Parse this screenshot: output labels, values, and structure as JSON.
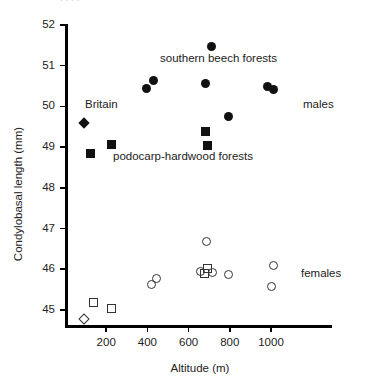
{
  "figure": {
    "axis_color": "#000000",
    "marker_filled_color": "#111111",
    "marker_open_color": "#333333",
    "top_cut_text": "· · · ·"
  },
  "annotations": {
    "britain": "Britain",
    "southern_beech": "southern beech forests",
    "podocarp": "podocarp-hardwood forests",
    "males": "males",
    "females": "females"
  },
  "chart_data": {
    "type": "scatter",
    "title": "",
    "xlabel": "Altitude (m)",
    "ylabel": "Condylobasal length (mm)",
    "xlim": [
      0,
      1300
    ],
    "ylim": [
      44.6,
      52
    ],
    "xticks": [
      200,
      400,
      600,
      800,
      1000
    ],
    "xtick_labels": [
      "200",
      "400",
      "600",
      "800",
      "1000"
    ],
    "yticks": [
      45,
      46,
      47,
      48,
      49,
      50,
      51,
      52
    ],
    "ytick_labels": [
      "45",
      "46",
      "47",
      "48",
      "49",
      "50",
      "51",
      "52"
    ],
    "grid": false,
    "legend_position": "right-inline",
    "series": [
      {
        "name": "males - southern beech forests",
        "marker": "circle-filled",
        "group": "males",
        "points": [
          {
            "x": 395,
            "y": 50.44
          },
          {
            "x": 432,
            "y": 50.63
          },
          {
            "x": 710,
            "y": 51.47
          },
          {
            "x": 680,
            "y": 50.56
          },
          {
            "x": 792,
            "y": 49.76
          },
          {
            "x": 985,
            "y": 50.48
          },
          {
            "x": 1010,
            "y": 50.41
          }
        ]
      },
      {
        "name": "males - podocarp-hardwood forests",
        "marker": "square-filled",
        "group": "males",
        "points": [
          {
            "x": 126,
            "y": 48.84
          },
          {
            "x": 228,
            "y": 49.07
          },
          {
            "x": 680,
            "y": 49.38
          },
          {
            "x": 690,
            "y": 49.05
          }
        ]
      },
      {
        "name": "males - Britain",
        "marker": "diamond-filled",
        "group": "males",
        "points": [
          {
            "x": 92,
            "y": 49.59
          }
        ]
      },
      {
        "name": "females - southern beech forests",
        "marker": "circle-open",
        "group": "females",
        "points": [
          {
            "x": 422,
            "y": 45.63
          },
          {
            "x": 442,
            "y": 45.78
          },
          {
            "x": 685,
            "y": 46.67
          },
          {
            "x": 660,
            "y": 45.95
          },
          {
            "x": 718,
            "y": 45.92
          },
          {
            "x": 796,
            "y": 45.87
          },
          {
            "x": 1010,
            "y": 46.08
          },
          {
            "x": 1000,
            "y": 45.57
          }
        ]
      },
      {
        "name": "females - podocarp-hardwood forests",
        "marker": "square-open",
        "group": "females",
        "points": [
          {
            "x": 136,
            "y": 45.19
          },
          {
            "x": 228,
            "y": 45.04
          },
          {
            "x": 694,
            "y": 46.02
          },
          {
            "x": 675,
            "y": 45.9
          }
        ]
      },
      {
        "name": "females - Britain",
        "marker": "diamond-open",
        "group": "females",
        "points": [
          {
            "x": 92,
            "y": 44.78
          }
        ]
      }
    ]
  }
}
